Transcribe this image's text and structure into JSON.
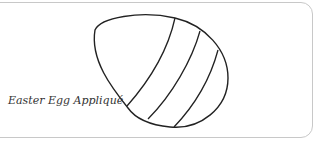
{
  "caption": "Easter Egg Appliqué",
  "illustration": {
    "subject": "egg-outline-icon",
    "stripe_count": 3,
    "stroke_color": "#222222"
  }
}
